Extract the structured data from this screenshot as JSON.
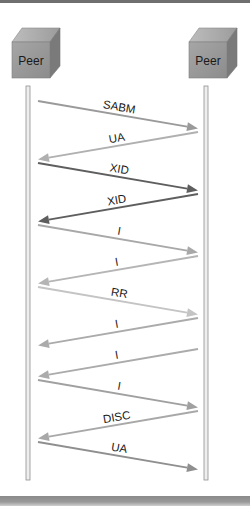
{
  "diagram": {
    "type": "sequence",
    "participants": [
      {
        "id": "left",
        "label": "Peer"
      },
      {
        "id": "right",
        "label": "Peer"
      }
    ],
    "messages": [
      {
        "label": "SABM",
        "from": "left",
        "to": "right",
        "color": "#9a9a9a"
      },
      {
        "label": "UA",
        "from": "right",
        "to": "left",
        "color": "#b0b0b0"
      },
      {
        "label": "XID",
        "from": "left",
        "to": "right",
        "color": "#5e5e5e"
      },
      {
        "label": "XID",
        "from": "right",
        "to": "left",
        "color": "#5e5e5e"
      },
      {
        "label": "I",
        "from": "left",
        "to": "right",
        "color": "#a8a8a8"
      },
      {
        "label": "I",
        "from": "right",
        "to": "left",
        "color": "#b5b5b5"
      },
      {
        "label": "RR",
        "from": "left",
        "to": "right",
        "color": "#c4c4c4"
      },
      {
        "label": "I",
        "from": "right",
        "to": "left",
        "color": "#ababab"
      },
      {
        "label": "I",
        "from": "right",
        "to": "left",
        "color": "#ababab"
      },
      {
        "label": "I",
        "from": "left",
        "to": "right",
        "color": "#a0a0a0"
      },
      {
        "label": "DISC",
        "from": "right",
        "to": "left",
        "color": "#a8a8a8"
      },
      {
        "label": "UA",
        "from": "left",
        "to": "right",
        "color": "#8f8f8f"
      }
    ]
  }
}
